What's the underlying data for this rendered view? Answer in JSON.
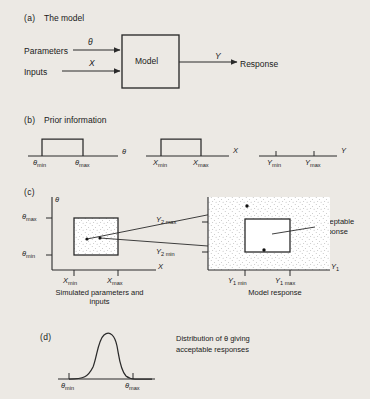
{
  "figure": {
    "background_color": "#ece9e4",
    "ink_color": "#2a2a2a"
  },
  "panels": {
    "a": {
      "id": "(a)",
      "heading": "The model",
      "inputs": [
        {
          "name": "Parameters",
          "symbol": "θ"
        },
        {
          "name": "Inputs",
          "symbol": "X"
        }
      ],
      "block_label": "Model",
      "output": {
        "name": "Response",
        "symbol": "Y"
      }
    },
    "b": {
      "id": "(b)",
      "heading": "Prior information",
      "distributions": [
        {
          "axis": "θ",
          "shape": "uniform",
          "min_label": "θ",
          "min_sub": "min",
          "max_label": "θ",
          "max_sub": "max"
        },
        {
          "axis": "X",
          "shape": "uniform",
          "min_label": "X",
          "min_sub": "min",
          "max_label": "X",
          "max_sub": "max"
        },
        {
          "axis": "Y",
          "shape": "ticks-only",
          "min_label": "Y",
          "min_sub": "min",
          "max_label": "Y",
          "max_sub": "max"
        }
      ]
    },
    "c": {
      "id": "(c)",
      "left_plot": {
        "caption_line1": "Simulated parameters and",
        "caption_line2": "inputs",
        "y_axis_label": "θ",
        "x_axis_label": "X",
        "y_max_label": "θ",
        "y_max_sub": "max",
        "y_min_label": "θ",
        "y_min_sub": "min",
        "x_min_label": "X",
        "x_min_sub": "min",
        "x_max_label": "X",
        "x_max_sub": "max",
        "region_fill": "stippled",
        "sample_points": [
          {
            "x": 0.3,
            "y": 0.45
          },
          {
            "x": 0.58,
            "y": 0.47
          }
        ]
      },
      "right_plot": {
        "caption": "Model response",
        "x_axis_label": "Y",
        "x_axis_sub": "1",
        "y_max_label": "Y",
        "y_max_sub": "2 max",
        "y_min_label": "Y",
        "y_min_sub": "2 min",
        "x_min_label": "Y",
        "x_min_sub": "1 min",
        "x_max_label": "Y",
        "x_max_sub": "1 max",
        "unacceptable_label": "Unacceptable",
        "unacceptable_label2": "response",
        "acceptable_label_line1": "Acceptable",
        "acceptable_label_line2": "response",
        "background_fill": "stippled",
        "acceptable_box_fill": "white",
        "response_points": [
          {
            "x": 0.46,
            "y": 0.86,
            "status": "unacceptable"
          },
          {
            "x": 0.61,
            "y": 0.27,
            "status": "acceptable"
          }
        ]
      },
      "mapping_arrows": 2
    },
    "d": {
      "id": "(d)",
      "annotation_line1": "Distribution of θ giving",
      "annotation_line2": "acceptable responses",
      "curve_type": "unimodal bell (right-skewed peak)",
      "min_label": "θ",
      "min_sub": "min",
      "max_label": "θ",
      "max_sub": "max"
    }
  }
}
